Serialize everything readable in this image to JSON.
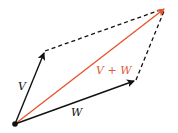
{
  "diagram": {
    "labels": {
      "v": "V",
      "w": "W",
      "sum": "V + W"
    },
    "points": {
      "origin": [
        15,
        124
      ],
      "v_tip": [
        45,
        51
      ],
      "w_tip": [
        136,
        80
      ],
      "sum_tip": [
        165,
        8
      ]
    },
    "colors": {
      "vector": "#111111",
      "sum": "#e8502a",
      "sum_label": "#e05a3a",
      "dashed": "#111111"
    }
  }
}
